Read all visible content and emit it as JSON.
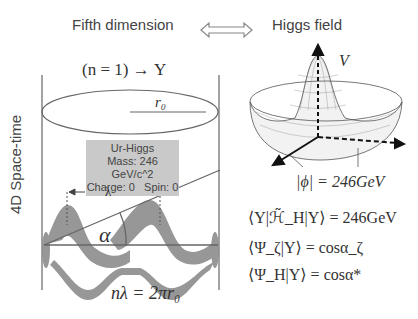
{
  "header": {
    "left_title": "Fifth dimension",
    "right_title": "Higgs field",
    "arrow_icon": "double-arrow-icon"
  },
  "left_panel": {
    "state_label": "(n = 1) → Υ",
    "radius_label": "r₀",
    "axis_label": "4D Space-time",
    "particle_box": {
      "name": "Ur-Higgs",
      "mass": "Mass: 246 GeV/c^2",
      "charge_spin": "Charge: 0   Spin: 0"
    },
    "wavelength_label": "λ",
    "angle_label": "α",
    "condition": "nλ = 2πr₀"
  },
  "right_panel": {
    "potential_label": "V",
    "vev_label": "|ϕ| = 246GeV",
    "equations": [
      "⟨Υ|ℋ̃_H|Υ⟩ = 246GeV",
      "⟨Ψ_ζ|Υ⟩ = cosα_ζ",
      "⟨Ψ_H|Υ⟩ = cosα*"
    ]
  },
  "colors": {
    "wave_fill": "#8c8c8c",
    "box_bg": "#c9c9c9",
    "line": "#666666"
  }
}
